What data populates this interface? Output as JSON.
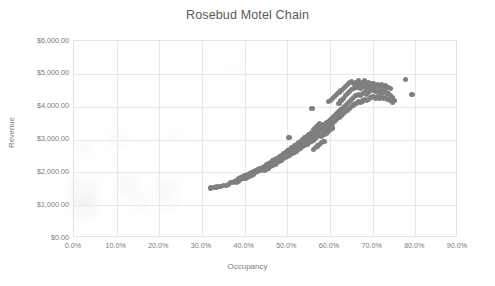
{
  "chart_data": {
    "type": "scatter",
    "title": "Rosebud Motel Chain",
    "xlabel": "Occupancy",
    "ylabel": "Revenue",
    "xlim": [
      0,
      0.9
    ],
    "ylim": [
      0,
      6000
    ],
    "grid": true,
    "legend": false,
    "marker_color": "#7f7f7f",
    "x_tick_labels": [
      "0.0%",
      "10.0%",
      "20.0%",
      "30.0%",
      "40.0%",
      "50.0%",
      "60.0%",
      "70.0%",
      "80.0%",
      "90.0%"
    ],
    "x_tick_values": [
      0,
      0.1,
      0.2,
      0.3,
      0.4,
      0.5,
      0.6,
      0.7,
      0.8,
      0.9
    ],
    "y_tick_labels": [
      "$0.00",
      "$1,000.00",
      "$2,000.00",
      "$3,000.00",
      "$4,000.00",
      "$5,000.00",
      "$6,000.00"
    ],
    "y_tick_values": [
      0,
      1000,
      2000,
      3000,
      4000,
      5000,
      6000
    ],
    "series": [
      {
        "name": "Occupancy vs Revenue",
        "points": [
          [
            0.319,
            1520
          ],
          [
            0.327,
            1540
          ],
          [
            0.334,
            1555
          ],
          [
            0.342,
            1575
          ],
          [
            0.35,
            1590
          ],
          [
            0.357,
            1610
          ],
          [
            0.362,
            1640
          ],
          [
            0.366,
            1680
          ],
          [
            0.371,
            1700
          ],
          [
            0.376,
            1730
          ],
          [
            0.381,
            1760
          ],
          [
            0.381,
            1690
          ],
          [
            0.386,
            1800
          ],
          [
            0.386,
            1730
          ],
          [
            0.391,
            1830
          ],
          [
            0.391,
            1770
          ],
          [
            0.396,
            1860
          ],
          [
            0.396,
            1800
          ],
          [
            0.401,
            1890
          ],
          [
            0.401,
            1830
          ],
          [
            0.406,
            1920
          ],
          [
            0.406,
            1860
          ],
          [
            0.411,
            1950
          ],
          [
            0.411,
            1890
          ],
          [
            0.416,
            1980
          ],
          [
            0.416,
            1920
          ],
          [
            0.421,
            2010
          ],
          [
            0.421,
            1950
          ],
          [
            0.426,
            2050
          ],
          [
            0.426,
            1985
          ],
          [
            0.431,
            2080
          ],
          [
            0.431,
            2015
          ],
          [
            0.436,
            2110
          ],
          [
            0.436,
            2045
          ],
          [
            0.441,
            2150
          ],
          [
            0.441,
            2080
          ],
          [
            0.446,
            2190
          ],
          [
            0.446,
            2120
          ],
          [
            0.446,
            2060
          ],
          [
            0.451,
            2230
          ],
          [
            0.451,
            2160
          ],
          [
            0.451,
            2095
          ],
          [
            0.456,
            2270
          ],
          [
            0.456,
            2200
          ],
          [
            0.456,
            2130
          ],
          [
            0.461,
            2310
          ],
          [
            0.461,
            2240
          ],
          [
            0.461,
            2170
          ],
          [
            0.466,
            2350
          ],
          [
            0.466,
            2280
          ],
          [
            0.466,
            2210
          ],
          [
            0.471,
            2390
          ],
          [
            0.471,
            2320
          ],
          [
            0.471,
            2250
          ],
          [
            0.476,
            2430
          ],
          [
            0.476,
            2360
          ],
          [
            0.476,
            2290
          ],
          [
            0.481,
            2470
          ],
          [
            0.481,
            2400
          ],
          [
            0.481,
            2330
          ],
          [
            0.486,
            2510
          ],
          [
            0.486,
            2440
          ],
          [
            0.486,
            2370
          ],
          [
            0.491,
            2560
          ],
          [
            0.491,
            2480
          ],
          [
            0.491,
            2410
          ],
          [
            0.496,
            2600
          ],
          [
            0.496,
            2520
          ],
          [
            0.496,
            2450
          ],
          [
            0.501,
            2650
          ],
          [
            0.501,
            2560
          ],
          [
            0.501,
            2490
          ],
          [
            0.504,
            3070
          ],
          [
            0.506,
            2700
          ],
          [
            0.506,
            2610
          ],
          [
            0.506,
            2530
          ],
          [
            0.511,
            2750
          ],
          [
            0.511,
            2650
          ],
          [
            0.511,
            2570
          ],
          [
            0.516,
            2800
          ],
          [
            0.516,
            2700
          ],
          [
            0.516,
            2610
          ],
          [
            0.521,
            2850
          ],
          [
            0.521,
            2750
          ],
          [
            0.521,
            2650
          ],
          [
            0.526,
            2900
          ],
          [
            0.526,
            2800
          ],
          [
            0.526,
            2700
          ],
          [
            0.531,
            2950
          ],
          [
            0.531,
            2850
          ],
          [
            0.531,
            2740
          ],
          [
            0.536,
            3000
          ],
          [
            0.536,
            2890
          ],
          [
            0.536,
            2780
          ],
          [
            0.541,
            3050
          ],
          [
            0.541,
            2930
          ],
          [
            0.541,
            2820
          ],
          [
            0.546,
            3100
          ],
          [
            0.546,
            2970
          ],
          [
            0.546,
            2860
          ],
          [
            0.551,
            3160
          ],
          [
            0.551,
            3020
          ],
          [
            0.551,
            2900
          ],
          [
            0.556,
            3220
          ],
          [
            0.556,
            3070
          ],
          [
            0.556,
            2940
          ],
          [
            0.558,
            3940
          ],
          [
            0.561,
            3290
          ],
          [
            0.561,
            3130
          ],
          [
            0.561,
            2980
          ],
          [
            0.561,
            2700
          ],
          [
            0.566,
            3350
          ],
          [
            0.566,
            3190
          ],
          [
            0.566,
            3030
          ],
          [
            0.566,
            2750
          ],
          [
            0.571,
            3420
          ],
          [
            0.571,
            3250
          ],
          [
            0.571,
            3080
          ],
          [
            0.571,
            2800
          ],
          [
            0.576,
            3480
          ],
          [
            0.576,
            3300
          ],
          [
            0.576,
            3130
          ],
          [
            0.576,
            2850
          ],
          [
            0.581,
            3400
          ],
          [
            0.581,
            3250
          ],
          [
            0.581,
            3100
          ],
          [
            0.581,
            2900
          ],
          [
            0.586,
            3450
          ],
          [
            0.586,
            3300
          ],
          [
            0.586,
            3150
          ],
          [
            0.586,
            2950
          ],
          [
            0.591,
            3500
          ],
          [
            0.591,
            3350
          ],
          [
            0.591,
            3200
          ],
          [
            0.596,
            4150
          ],
          [
            0.596,
            3560
          ],
          [
            0.596,
            3400
          ],
          [
            0.596,
            3250
          ],
          [
            0.601,
            4200
          ],
          [
            0.601,
            3620
          ],
          [
            0.601,
            3450
          ],
          [
            0.601,
            3300
          ],
          [
            0.606,
            4260
          ],
          [
            0.606,
            3680
          ],
          [
            0.606,
            3500
          ],
          [
            0.606,
            3350
          ],
          [
            0.611,
            4320
          ],
          [
            0.611,
            3740
          ],
          [
            0.611,
            3560
          ],
          [
            0.616,
            4380
          ],
          [
            0.616,
            3800
          ],
          [
            0.616,
            3620
          ],
          [
            0.621,
            4440
          ],
          [
            0.621,
            4100
          ],
          [
            0.621,
            3860
          ],
          [
            0.621,
            3680
          ],
          [
            0.626,
            4500
          ],
          [
            0.626,
            4180
          ],
          [
            0.626,
            3920
          ],
          [
            0.626,
            3740
          ],
          [
            0.631,
            4560
          ],
          [
            0.631,
            4250
          ],
          [
            0.631,
            3980
          ],
          [
            0.631,
            3800
          ],
          [
            0.636,
            4620
          ],
          [
            0.636,
            4330
          ],
          [
            0.636,
            4040
          ],
          [
            0.636,
            3850
          ],
          [
            0.641,
            4680
          ],
          [
            0.641,
            4400
          ],
          [
            0.641,
            4100
          ],
          [
            0.641,
            3900
          ],
          [
            0.646,
            4730
          ],
          [
            0.646,
            4460
          ],
          [
            0.646,
            4160
          ],
          [
            0.646,
            3950
          ],
          [
            0.651,
            4760
          ],
          [
            0.651,
            4520
          ],
          [
            0.651,
            4220
          ],
          [
            0.651,
            4000
          ],
          [
            0.656,
            4700
          ],
          [
            0.656,
            4560
          ],
          [
            0.656,
            4280
          ],
          [
            0.656,
            4050
          ],
          [
            0.661,
            4740
          ],
          [
            0.661,
            4600
          ],
          [
            0.661,
            4330
          ],
          [
            0.661,
            4100
          ],
          [
            0.666,
            4780
          ],
          [
            0.666,
            4640
          ],
          [
            0.666,
            4380
          ],
          [
            0.666,
            4150
          ],
          [
            0.671,
            4700
          ],
          [
            0.671,
            4560
          ],
          [
            0.671,
            4340
          ],
          [
            0.671,
            4120
          ],
          [
            0.676,
            4740
          ],
          [
            0.676,
            4600
          ],
          [
            0.676,
            4390
          ],
          [
            0.676,
            4170
          ],
          [
            0.681,
            4780
          ],
          [
            0.681,
            4640
          ],
          [
            0.681,
            4430
          ],
          [
            0.681,
            4210
          ],
          [
            0.686,
            4700
          ],
          [
            0.686,
            4560
          ],
          [
            0.686,
            4380
          ],
          [
            0.686,
            4180
          ],
          [
            0.691,
            4740
          ],
          [
            0.691,
            4600
          ],
          [
            0.691,
            4420
          ],
          [
            0.691,
            4230
          ],
          [
            0.696,
            4660
          ],
          [
            0.696,
            4500
          ],
          [
            0.696,
            4280
          ],
          [
            0.701,
            4700
          ],
          [
            0.701,
            4540
          ],
          [
            0.701,
            4320
          ],
          [
            0.706,
            4620
          ],
          [
            0.706,
            4460
          ],
          [
            0.706,
            4260
          ],
          [
            0.711,
            4660
          ],
          [
            0.711,
            4500
          ],
          [
            0.711,
            4300
          ],
          [
            0.716,
            4620
          ],
          [
            0.716,
            4440
          ],
          [
            0.716,
            4260
          ],
          [
            0.721,
            4660
          ],
          [
            0.721,
            4480
          ],
          [
            0.721,
            4300
          ],
          [
            0.726,
            4600
          ],
          [
            0.726,
            4420
          ],
          [
            0.726,
            4250
          ],
          [
            0.731,
            4640
          ],
          [
            0.731,
            4460
          ],
          [
            0.731,
            4290
          ],
          [
            0.736,
            4580
          ],
          [
            0.736,
            4400
          ],
          [
            0.736,
            4230
          ],
          [
            0.741,
            4560
          ],
          [
            0.741,
            4340
          ],
          [
            0.741,
            4180
          ],
          [
            0.746,
            4280
          ],
          [
            0.746,
            4140
          ],
          [
            0.751,
            4200
          ],
          [
            0.777,
            4830
          ],
          [
            0.792,
            4370
          ]
        ]
      }
    ]
  },
  "axes": {
    "y_title": "Revenue",
    "x_title": "Occupancy"
  }
}
